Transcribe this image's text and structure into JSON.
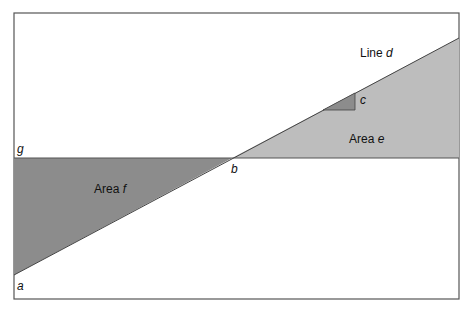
{
  "diagram": {
    "colors": {
      "background": "#ffffff",
      "frame": "#555555",
      "area_e": "#bdbdbd",
      "area_f": "#8c8c8c",
      "triangle_c": "#8c8c8c",
      "line": "#444444"
    },
    "labels": {
      "line_d_prefix": "Line",
      "line_d_var": "d",
      "area_e_prefix": "Area",
      "area_e_var": "e",
      "area_f_prefix": "Area",
      "area_f_var": "f",
      "point_a": "a",
      "point_b": "b",
      "point_c": "c",
      "point_g": "g"
    }
  }
}
